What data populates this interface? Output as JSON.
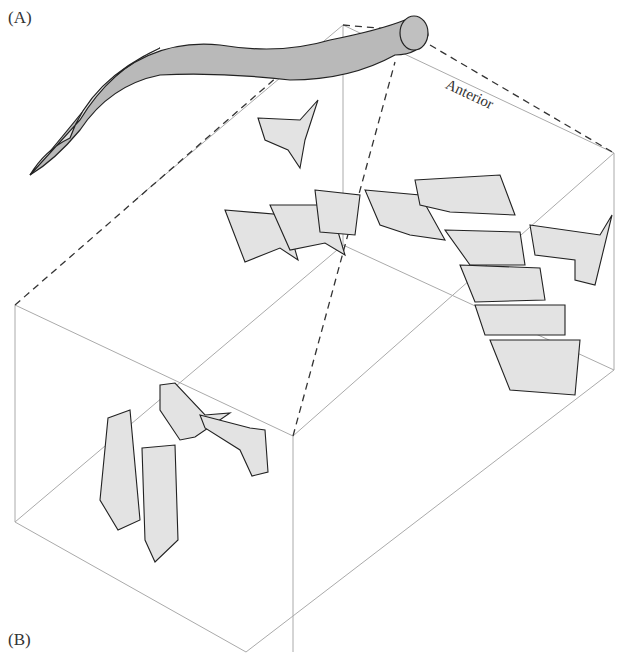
{
  "figure": {
    "panel_a_label": "(A)",
    "panel_b_label": "(B)",
    "orientation_label": "Anterior",
    "colors": {
      "element_fill": "#e3e3e3",
      "body_fill": "#b9b9b9",
      "outline": "#222222",
      "box_line": "#aaaaaa",
      "dash_line": "#333333"
    },
    "elements": {
      "s_elements_row_count": 4,
      "m_element_count": 1,
      "stacked_elements_count": 5,
      "p_elements_count": 4
    }
  }
}
